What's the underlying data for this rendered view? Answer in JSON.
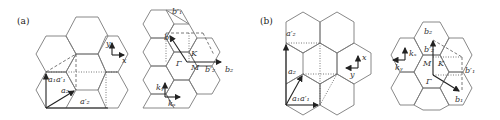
{
  "panels": [
    {
      "id": "a",
      "label": "(a)",
      "real_space": {
        "vectors": [
          "a⃗1a⃗′1",
          "a⃗2",
          "a⃗′2"
        ],
        "axes": {
          "y": "y",
          "x": "x"
        }
      },
      "reciprocal_space": {
        "vectors": [
          "b⃗′1",
          "b⃗1",
          "b⃗2",
          "b⃗′2"
        ],
        "points": {
          "gamma": "Γ",
          "M": "M",
          "K": "K"
        },
        "axes": {
          "ky": "k",
          "ky_sub": "y",
          "kx": "k",
          "kx_sub": "x"
        }
      }
    },
    {
      "id": "b",
      "label": "(b)",
      "real_space": {
        "vectors": [
          "a⃗′2",
          "a⃗2",
          "a⃗1a⃗′1"
        ],
        "axes": {
          "x": "x",
          "y": "y"
        }
      },
      "reciprocal_space": {
        "vectors": [
          "b⃗2",
          "b⃗′2",
          "b⃗′1",
          "b⃗1"
        ],
        "points": {
          "gamma": "Γ",
          "M": "M",
          "K": "K"
        },
        "axes": {
          "kx": "k",
          "kx_sub": "x",
          "ky": "k",
          "ky_sub": "y"
        }
      }
    }
  ],
  "labels": {
    "a_label": "(a)",
    "b_label": "(b)",
    "a1a1p": "a₁a′₁",
    "a2": "a₂",
    "a2p": "a′₂",
    "b1": "b₁",
    "b1p": "b′₁",
    "b2": "b₂",
    "b2p": "b′₂",
    "gamma": "Γ",
    "M": "M",
    "K": "K",
    "x": "x",
    "y": "y",
    "kx": "kₓ",
    "ky": "kᵧ"
  }
}
